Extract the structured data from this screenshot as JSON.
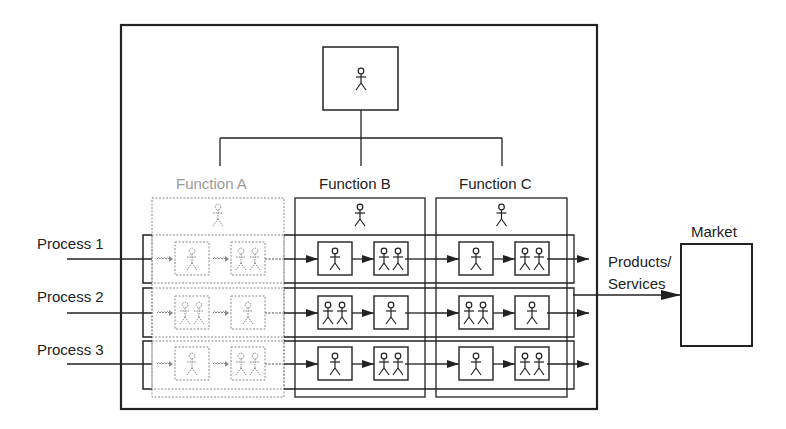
{
  "diagram": {
    "top_manager": {
      "icon": "person-icon"
    },
    "functions": [
      {
        "label": "Function A",
        "style": "dashed",
        "icon": "person-icon"
      },
      {
        "label": "Function B",
        "style": "solid",
        "icon": "person-icon"
      },
      {
        "label": "Function C",
        "style": "solid",
        "icon": "person-icon"
      }
    ],
    "processes": [
      {
        "label": "Process 1",
        "steps": [
          [
            1,
            2
          ],
          [
            1,
            2
          ],
          [
            1,
            2
          ]
        ]
      },
      {
        "label": "Process 2",
        "steps": [
          [
            2,
            1
          ],
          [
            2,
            1
          ],
          [
            2,
            1
          ]
        ]
      },
      {
        "label": "Process 3",
        "steps": [
          [
            1,
            2
          ],
          [
            1,
            2
          ],
          [
            1,
            2
          ]
        ]
      }
    ],
    "output_label_line1": "Products/",
    "output_label_line2": "Services",
    "market_label": "Market",
    "colors": {
      "stroke": "#222222",
      "faded": "#8a8a8a",
      "background": "#ffffff"
    }
  }
}
